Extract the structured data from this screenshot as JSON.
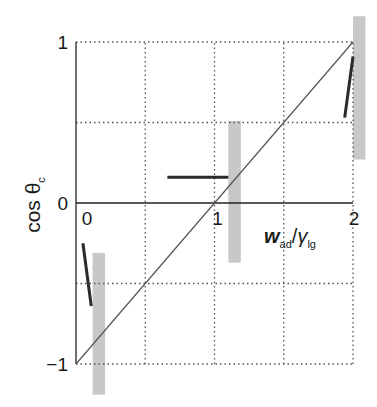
{
  "chart_data": {
    "type": "line",
    "title": "",
    "xlabel": "w_ad/γ_lg",
    "xlabel_parts": {
      "main": "w",
      "main_sub": "ad",
      "slash": "/",
      "second": "γ",
      "second_sub": "lg"
    },
    "ylabel": "cos θ_c",
    "ylabel_parts": {
      "main": "cos θ",
      "sub": "c"
    },
    "xlim": [
      0,
      2
    ],
    "ylim": [
      -1,
      1
    ],
    "x_ticks": [
      {
        "value": 0,
        "label": "0"
      },
      {
        "value": 1,
        "label": "1"
      },
      {
        "value": 2,
        "label": "2"
      }
    ],
    "y_ticks": [
      {
        "value": 1,
        "label": "1"
      },
      {
        "value": 0,
        "label": "0"
      },
      {
        "value": -1,
        "label": "-1"
      }
    ],
    "grid": {
      "on": true,
      "style": "dotted",
      "x": [
        0.5,
        1,
        1.5,
        2
      ],
      "y": [
        -1,
        -0.5,
        0.5,
        1
      ]
    },
    "series": [
      {
        "name": "Young-Dupre line cos θc = w_ad/γ_lg − 1",
        "kind": "line",
        "x": [
          0,
          2
        ],
        "y": [
          -1,
          1
        ],
        "color": "#555555"
      },
      {
        "name": "measured segment near 0",
        "kind": "segment",
        "x": [
          0.05,
          0.11
        ],
        "y": [
          -0.25,
          -0.64
        ],
        "color": "#2a2a2a"
      },
      {
        "name": "measured segment near 1",
        "kind": "segment",
        "x": [
          0.66,
          1.1
        ],
        "y": [
          0.16,
          0.16
        ],
        "color": "#2a2a2a"
      },
      {
        "name": "measured segment near 2",
        "kind": "segment",
        "x": [
          1.94,
          2.0
        ],
        "y": [
          0.53,
          0.91
        ],
        "color": "#2a2a2a"
      }
    ],
    "bands": [
      {
        "name": "uncertainty band near 0",
        "x": [
          0.12,
          0.21
        ],
        "y": [
          -1.19,
          -0.31
        ],
        "color": "#c8c8c8"
      },
      {
        "name": "uncertainty band near 1",
        "x": [
          1.1,
          1.19
        ],
        "y": [
          -0.37,
          0.51
        ],
        "color": "#c8c8c8"
      },
      {
        "name": "uncertainty band near 2",
        "x": [
          2.0,
          2.09
        ],
        "y": [
          0.27,
          1.16
        ],
        "color": "#c8c8c8"
      }
    ]
  }
}
